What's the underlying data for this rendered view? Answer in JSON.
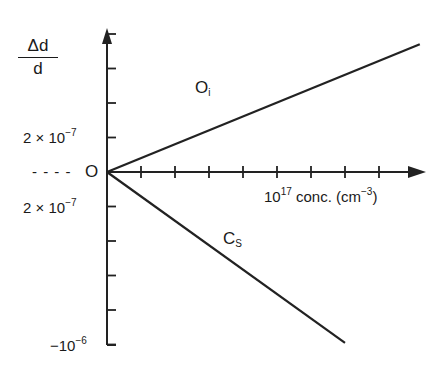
{
  "chart_data": {
    "type": "line",
    "title": "",
    "ylabel": {
      "numerator": "Δd",
      "denominator": "d"
    },
    "xlabel": {
      "base": "10",
      "exp": "17",
      "text": " conc. (cm",
      "unit_exp": "−3",
      "close": ")"
    },
    "origin_label": "O",
    "origin_dashes": "- - - -",
    "y_tick_labels": [
      {
        "value": 2e-07,
        "base": "2 × 10",
        "exp": "−7"
      },
      {
        "value": -2e-07,
        "base": "2 × 10",
        "exp": "−7"
      },
      {
        "value": -1e-06,
        "base": "−10",
        "exp": "−6"
      }
    ],
    "x_ticks": [
      1,
      2,
      3,
      4,
      5,
      6,
      7,
      8
    ],
    "y_ticks": [
      8e-07,
      6e-07,
      4e-07,
      2e-07,
      -2e-07,
      -4e-07,
      -6e-07,
      -8e-07,
      -1e-06
    ],
    "grid": false,
    "series": [
      {
        "name": "Oi",
        "label_base": "O",
        "label_sub": "i",
        "x": [
          0,
          9.2
        ],
        "y": [
          0,
          7.4e-07
        ]
      },
      {
        "name": "Cs",
        "label_base": "C",
        "label_sub": "S",
        "x": [
          0,
          7.0
        ],
        "y": [
          0,
          -9.9e-07
        ]
      }
    ],
    "xlim": [
      0,
      9.5
    ],
    "ylim": [
      -1e-06,
      8e-07
    ]
  }
}
